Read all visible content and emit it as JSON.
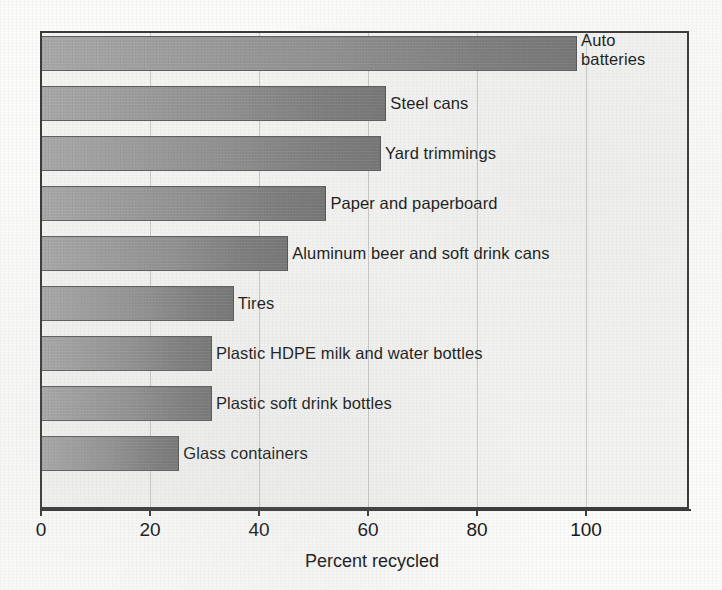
{
  "chart_data": {
    "type": "bar",
    "orientation": "horizontal",
    "title": "",
    "xlabel": "Percent recycled",
    "ylabel": "",
    "xlim": [
      0,
      119
    ],
    "ylim": null,
    "grid": true,
    "legend": null,
    "xticks": [
      0,
      20,
      40,
      60,
      80,
      100
    ],
    "xtick_labels": [
      "0",
      "20",
      "40",
      "60",
      "80",
      "100"
    ],
    "categories": [
      "Auto batteries",
      "Steel cans",
      "Yard trimmings",
      "Paper and paperboard",
      "Aluminum beer and soft drink cans",
      "Tires",
      "Plastic HDPE milk and water bottles",
      "Plastic soft drink bottles",
      "Glass containers"
    ],
    "values": [
      98,
      63,
      62,
      52,
      45,
      35,
      31,
      31,
      25
    ],
    "bars": [
      {
        "label": "Auto batteries",
        "label_line_1": "Auto",
        "label_line_2": "batteries",
        "value": 98
      },
      {
        "label": "Steel cans",
        "label_line_1": "Steel cans",
        "value": 63
      },
      {
        "label": "Yard trimmings",
        "label_line_1": "Yard trimmings",
        "value": 62
      },
      {
        "label": "Paper and paperboard",
        "label_line_1": "Paper and paperboard",
        "value": 52
      },
      {
        "label": "Aluminum beer and soft drink cans",
        "label_line_1": "Aluminum beer and soft drink cans",
        "value": 45
      },
      {
        "label": "Tires",
        "label_line_1": "Tires",
        "value": 35
      },
      {
        "label": "Plastic HDPE milk and water bottles",
        "label_line_1": "Plastic HDPE milk and water bottles",
        "value": 31
      },
      {
        "label": "Plastic soft drink bottles",
        "label_line_1": "Plastic soft drink bottles",
        "value": 31
      },
      {
        "label": "Glass containers",
        "label_line_1": "Glass containers",
        "value": 25
      }
    ],
    "colors": {
      "bar_light": "#a8a8a8",
      "bar_dark": "#757575",
      "bar_outline": "#5e5e5e",
      "plot_background": "#f3f3f2",
      "gridline": "#c9c9c9",
      "axis": "#3a3a3a",
      "text": "#151515"
    }
  }
}
